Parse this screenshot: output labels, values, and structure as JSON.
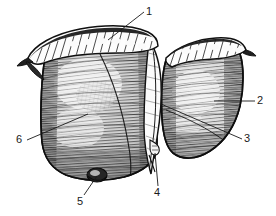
{
  "figure": {
    "type": "anatomical-engraving",
    "view": "anterior-diaphragmatic-surface",
    "background_color": "#ffffff",
    "ink_color": "#1d1d1d",
    "fill_tone": "#9a9a9a",
    "highlight_tone": "#e8e8e8",
    "label_font_size_px": 11
  },
  "labels": [
    {
      "id": "1",
      "text": "1",
      "x": 146,
      "y": 6,
      "target_x": 108,
      "target_y": 40,
      "leader": "diagonal-down-left"
    },
    {
      "id": "2",
      "text": "2",
      "x": 257,
      "y": 95,
      "target_x": 214,
      "target_y": 102,
      "leader": "horizontal-left"
    },
    {
      "id": "3",
      "text": "3",
      "x": 244,
      "y": 133,
      "target_x": 161,
      "target_y": 104,
      "leader": "diagonal-up-left"
    },
    {
      "id": "4",
      "text": "4",
      "x": 154,
      "y": 187,
      "target_x": 155,
      "target_y": 152,
      "leader": "vertical-up"
    },
    {
      "id": "5",
      "text": "5",
      "x": 77,
      "y": 196,
      "target_x": 97,
      "target_y": 174,
      "leader": "diagonal-up-right"
    },
    {
      "id": "6",
      "text": "6",
      "x": 16,
      "y": 134,
      "target_x": 88,
      "target_y": 114,
      "leader": "diagonal-up-right"
    }
  ],
  "structures": [
    {
      "name": "right-lobe",
      "side": "left-of-image"
    },
    {
      "name": "left-lobe",
      "side": "right-of-image"
    },
    {
      "name": "falciform-ligament",
      "side": "center"
    },
    {
      "name": "coronary-ligament",
      "side": "superior"
    },
    {
      "name": "gallbladder-fundus",
      "side": "inferior-left"
    },
    {
      "name": "round-ligament",
      "side": "inferior-center"
    }
  ]
}
